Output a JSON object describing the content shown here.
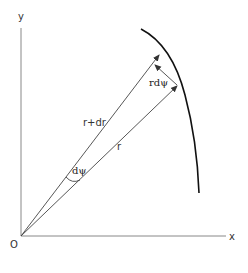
{
  "diagram": {
    "type": "polar-coordinate-geometry",
    "axes": {
      "x_label": "x",
      "y_label": "y",
      "origin_label": "O"
    },
    "vectors": [
      {
        "id": "r_plus_dr",
        "label": "r+dr"
      },
      {
        "id": "r",
        "label": "r"
      }
    ],
    "arc_length_label": "rdψ",
    "angle_label": "dψ",
    "colors": {
      "axis": "#777777",
      "vector": "#444444",
      "curve": "#111111",
      "text": "#333333"
    }
  }
}
